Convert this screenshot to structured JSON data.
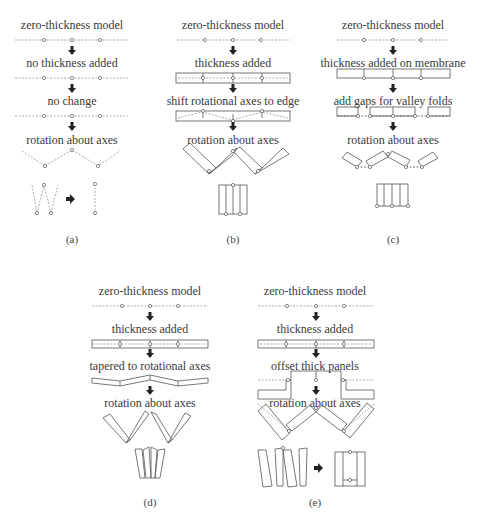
{
  "panels": [
    {
      "id": "a",
      "label": "(a)",
      "steps": [
        "zero-thickness model",
        "no thickness added",
        "no change",
        "rotation about axes"
      ]
    },
    {
      "id": "b",
      "label": "(b)",
      "steps": [
        "zero-thickness model",
        "thickness added",
        "shift rotational axes to edge",
        "rotation about axes"
      ]
    },
    {
      "id": "c",
      "label": "(c)",
      "steps": [
        "zero-thickness model",
        "thickness added on membrane",
        "add gaps for valley folds",
        "rotation about axes"
      ]
    },
    {
      "id": "d",
      "label": "(d)",
      "steps": [
        "zero-thickness model",
        "thickness added",
        "tapered  to rotational axes",
        "rotation about axes"
      ]
    },
    {
      "id": "e",
      "label": "(e)",
      "steps": [
        "zero-thickness model",
        "thickness added",
        "offset thick panels",
        "rotation about axes"
      ]
    }
  ],
  "colors": {
    "line": "#555555",
    "dashed": "#888888",
    "text": "#3a3a3a"
  }
}
